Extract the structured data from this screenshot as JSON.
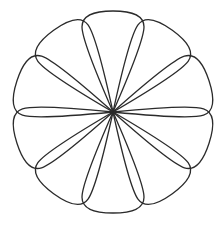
{
  "canvas": {
    "width": 223,
    "height": 226,
    "background_color": "#ffffff"
  },
  "figure": {
    "name": "ten-petal-flower-rosette",
    "style": "line-art-outline",
    "stroke_color": "#2b2b2b",
    "fill_color": "none",
    "stroke_width": 1.3
  },
  "chart_data": {
    "type": "scatter",
    "title": "",
    "subtitle": "",
    "xlabel": "",
    "ylabel": "",
    "grid": false,
    "legend": null,
    "center": {
      "x": 113,
      "y": 112
    },
    "petal_count": 10,
    "angle_step_degrees": 36,
    "angle_offset_degrees": 18,
    "petal_length": 99,
    "petal_half_width": 31,
    "bounds": {
      "left": 14,
      "top": 13,
      "right": 212,
      "bottom": 211
    },
    "petal_angles_degrees": [
      18,
      54,
      90,
      126,
      162,
      198,
      234,
      270,
      306,
      342
    ],
    "petals": [
      {
        "index": 1,
        "angle": 18,
        "tip_x": 207,
        "tip_y": 81
      },
      {
        "index": 2,
        "angle": 54,
        "tip_x": 171,
        "tip_y": 32
      },
      {
        "index": 3,
        "angle": 90,
        "tip_x": 113,
        "tip_y": 13
      },
      {
        "index": 4,
        "angle": 126,
        "tip_x": 55,
        "tip_y": 32
      },
      {
        "index": 5,
        "angle": 162,
        "tip_x": 19,
        "tip_y": 81
      },
      {
        "index": 6,
        "angle": 198,
        "tip_x": 19,
        "tip_y": 143
      },
      {
        "index": 7,
        "angle": 234,
        "tip_x": 55,
        "tip_y": 192
      },
      {
        "index": 8,
        "angle": 270,
        "tip_x": 113,
        "tip_y": 211
      },
      {
        "index": 9,
        "angle": 306,
        "tip_x": 171,
        "tip_y": 192
      },
      {
        "index": 10,
        "angle": 342,
        "tip_x": 207,
        "tip_y": 143
      }
    ]
  }
}
